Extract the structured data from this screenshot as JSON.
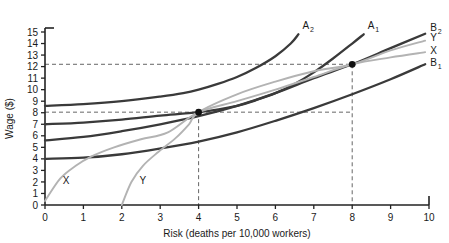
{
  "chart_data": {
    "type": "line",
    "title": "",
    "xlabel": "Risk (deaths per 10,000 workers)",
    "ylabel": "Wage ($)",
    "xlim": [
      0,
      10
    ],
    "ylim": [
      0,
      15
    ],
    "grid": false,
    "legend": "inline-curve-labels",
    "xticks": [
      "0",
      "1",
      "2",
      "3",
      "4",
      "5",
      "6",
      "7",
      "8",
      "9",
      "10"
    ],
    "yticks": [
      "0",
      "1",
      "2",
      "3",
      "4",
      "5",
      "6",
      "7",
      "8",
      "9",
      "10",
      "11",
      "12",
      "13",
      "14",
      "15"
    ],
    "series": [
      {
        "name": "A2",
        "label_main": "A",
        "label_sub": "2",
        "role": "worker-indifference-curve",
        "color": "#3a3a3a",
        "points": [
          [
            0.0,
            8.6
          ],
          [
            1.0,
            8.75
          ],
          [
            2.0,
            9.0
          ],
          [
            3.0,
            9.4
          ],
          [
            3.6,
            9.7
          ],
          [
            4.0,
            10.0
          ],
          [
            4.5,
            10.5
          ],
          [
            5.0,
            11.1
          ],
          [
            5.5,
            11.9
          ],
          [
            6.0,
            12.9
          ],
          [
            6.4,
            14.0
          ],
          [
            6.6,
            14.8
          ]
        ]
      },
      {
        "name": "A1",
        "label_main": "A",
        "label_sub": "1",
        "role": "worker-indifference-curve",
        "color": "#3a3a3a",
        "points": [
          [
            0.0,
            7.0
          ],
          [
            1.0,
            7.15
          ],
          [
            2.0,
            7.4
          ],
          [
            3.0,
            7.75
          ],
          [
            4.0,
            8.05
          ],
          [
            5.0,
            8.6
          ],
          [
            5.5,
            9.1
          ],
          [
            6.0,
            9.7
          ],
          [
            6.5,
            10.5
          ],
          [
            7.0,
            11.5
          ],
          [
            7.5,
            12.7
          ],
          [
            8.0,
            14.0
          ],
          [
            8.3,
            14.8
          ]
        ]
      },
      {
        "name": "B2",
        "label_main": "B",
        "label_sub": "2",
        "role": "firm-isoprofit-curve",
        "color": "#3a3a3a",
        "points": [
          [
            0.0,
            5.6
          ],
          [
            1.0,
            5.9
          ],
          [
            2.0,
            6.4
          ],
          [
            3.0,
            7.0
          ],
          [
            4.0,
            7.7
          ],
          [
            5.0,
            8.6
          ],
          [
            6.0,
            9.7
          ],
          [
            7.0,
            11.0
          ],
          [
            8.0,
            12.2
          ],
          [
            9.0,
            13.6
          ],
          [
            9.9,
            14.85
          ]
        ]
      },
      {
        "name": "B1",
        "label_main": "B",
        "label_sub": "1",
        "role": "firm-isoprofit-curve",
        "color": "#3a3a3a",
        "points": [
          [
            0.0,
            4.0
          ],
          [
            1.0,
            4.1
          ],
          [
            2.0,
            4.4
          ],
          [
            3.0,
            4.9
          ],
          [
            4.0,
            5.5
          ],
          [
            5.0,
            6.3
          ],
          [
            6.0,
            7.3
          ],
          [
            7.0,
            8.4
          ],
          [
            8.0,
            9.6
          ],
          [
            9.0,
            10.9
          ],
          [
            9.9,
            12.2
          ]
        ]
      },
      {
        "name": "X",
        "label_main": "X",
        "label_sub": "",
        "role": "market-offer-curve",
        "color": "#b3b3b3",
        "points": [
          [
            0.0,
            0.35
          ],
          [
            0.4,
            2.3
          ],
          [
            0.8,
            3.4
          ],
          [
            1.2,
            4.2
          ],
          [
            1.8,
            5.0
          ],
          [
            2.5,
            5.7
          ],
          [
            3.2,
            6.3
          ],
          [
            4.0,
            8.05
          ],
          [
            5.0,
            9.0
          ],
          [
            6.0,
            10.0
          ],
          [
            7.0,
            11.1
          ],
          [
            8.0,
            12.2
          ],
          [
            9.0,
            12.8
          ],
          [
            9.9,
            13.25
          ]
        ]
      },
      {
        "name": "Y",
        "label_main": "Y",
        "label_sub": "",
        "role": "market-offer-curve",
        "color": "#b3b3b3",
        "points": [
          [
            2.0,
            0.0
          ],
          [
            2.25,
            2.0
          ],
          [
            2.55,
            3.4
          ],
          [
            2.95,
            4.6
          ],
          [
            3.4,
            5.8
          ],
          [
            3.75,
            7.0
          ],
          [
            4.0,
            8.05
          ],
          [
            5.0,
            9.6
          ],
          [
            6.0,
            10.7
          ],
          [
            7.0,
            11.6
          ],
          [
            8.0,
            12.2
          ],
          [
            9.0,
            13.4
          ],
          [
            9.9,
            14.25
          ]
        ]
      }
    ],
    "equilibrium_points": [
      {
        "name": "equilibrium-low",
        "x": 4,
        "y": 8.05
      },
      {
        "name": "equilibrium-high",
        "x": 8,
        "y": 12.2
      }
    ],
    "guide_lines": [
      {
        "name": "dashed-wage-8",
        "orientation": "horizontal",
        "value": 8.05
      },
      {
        "name": "dashed-wage-12",
        "orientation": "horizontal",
        "value": 12.2
      },
      {
        "name": "dashed-risk-4",
        "orientation": "vertical",
        "value": 4
      },
      {
        "name": "dashed-risk-8",
        "orientation": "vertical",
        "value": 8
      }
    ]
  }
}
